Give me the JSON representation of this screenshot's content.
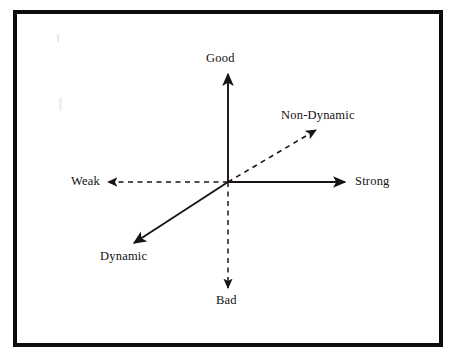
{
  "figure": {
    "type": "semantic-differential-axes-diagram",
    "caption_visible_fragment": "",
    "frame": {
      "color": "#100c0c",
      "border_width_px": 4
    }
  },
  "labels": {
    "good": "Good",
    "bad": "Bad",
    "weak": "Weak",
    "strong": "Strong",
    "dynamic": "Dynamic",
    "non_dynamic": "Non-Dynamic"
  },
  "chart_data": {
    "type": "scatter",
    "title": "",
    "subtitle": "",
    "xlabel": "",
    "ylabel": "",
    "grid": false,
    "legend": "none",
    "origin": {
      "x": 228,
      "y": 182
    },
    "axes": [
      {
        "name": "good",
        "label": "Good",
        "direction": "up",
        "style": "solid",
        "arrow": "end",
        "color": "#1a1414",
        "from": {
          "x": 228,
          "y": 182
        },
        "to": {
          "x": 228,
          "y": 74
        }
      },
      {
        "name": "bad",
        "label": "Bad",
        "direction": "down",
        "style": "dashed",
        "arrow": "end",
        "color": "#1a1414",
        "from": {
          "x": 228,
          "y": 182
        },
        "to": {
          "x": 228,
          "y": 288
        }
      },
      {
        "name": "strong",
        "label": "Strong",
        "direction": "right",
        "style": "solid",
        "arrow": "end",
        "color": "#1a1414",
        "from": {
          "x": 228,
          "y": 182
        },
        "to": {
          "x": 345,
          "y": 182
        }
      },
      {
        "name": "weak",
        "label": "Weak",
        "direction": "left",
        "style": "dashed",
        "arrow": "end",
        "color": "#1a1414",
        "from": {
          "x": 228,
          "y": 182
        },
        "to": {
          "x": 108,
          "y": 182
        }
      },
      {
        "name": "non-dynamic",
        "label": "Non-Dynamic",
        "direction": "up-right",
        "style": "dashed",
        "arrow": "end",
        "color": "#1a1414",
        "from": {
          "x": 228,
          "y": 182
        },
        "to": {
          "x": 316,
          "y": 130
        }
      },
      {
        "name": "dynamic",
        "label": "Dynamic",
        "direction": "down-left",
        "style": "solid",
        "arrow": "end",
        "color": "#1a1414",
        "from": {
          "x": 228,
          "y": 182
        },
        "to": {
          "x": 134,
          "y": 243
        }
      }
    ]
  }
}
